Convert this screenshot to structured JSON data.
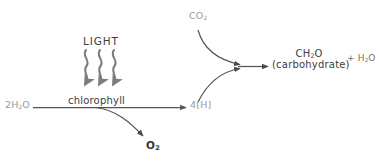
{
  "diagram": {
    "type": "process-flow",
    "colors": {
      "reactant_gray": "#9a9a9a",
      "structure_dark": "#3d3d3d",
      "arrow_gray": "#555555",
      "wavy_arrow_gray": "#7d7d7d",
      "background": "#ffffff"
    },
    "labels": {
      "water_in": "2H",
      "water_in_sub": "2",
      "water_in_tail": "O",
      "light": "LIGHT",
      "chlorophyll": "chlorophyll",
      "oxygen": "O",
      "oxygen_sub": "2",
      "reduced_hydrogen": "4[H]",
      "carbon_dioxide": "CO",
      "carbon_dioxide_sub": "2",
      "product_formula": "CH",
      "product_formula_sub": "2",
      "product_formula_tail": "O",
      "product_name": "(carbohydrate)",
      "product_side_plus": "+ H",
      "product_side_sub": "2",
      "product_side_tail": "O"
    },
    "icons": {
      "wavy_light_arrow": "wavy-down-arrow-icon",
      "reaction_arrow": "arrow-right-icon",
      "branch_arrow": "curved-arrow-icon"
    }
  }
}
